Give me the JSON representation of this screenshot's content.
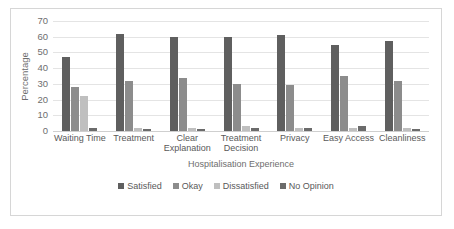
{
  "chart_data": {
    "type": "bar",
    "title": "",
    "xlabel": "Hospitalisation Experience",
    "ylabel": "Percentage",
    "ylim": [
      0,
      70
    ],
    "yticks": [
      0,
      10,
      20,
      30,
      40,
      50,
      60,
      70
    ],
    "grid": true,
    "legend_position": "bottom",
    "categories": [
      "Waiting Time",
      "Treatment",
      "Clear Explanation",
      "Treatment Decision",
      "Privacy",
      "Easy Access",
      "Cleanliness"
    ],
    "series": [
      {
        "name": "Satisfied",
        "color": "#5f5f5f",
        "values": [
          47,
          62,
          60,
          60,
          61,
          55,
          57
        ]
      },
      {
        "name": "Okay",
        "color": "#8c8c8c",
        "values": [
          28,
          32,
          34,
          30,
          29,
          35,
          32
        ]
      },
      {
        "name": "Dissatisfied",
        "color": "#bfbfbf",
        "values": [
          22,
          2,
          2,
          3,
          2,
          2,
          2
        ]
      },
      {
        "name": "No Opinion",
        "color": "#6b6b6b",
        "values": [
          2,
          1,
          1,
          2,
          2,
          3,
          1
        ]
      }
    ]
  },
  "axis": {
    "y_title": "Percentage",
    "x_title": "Hospitalisation Experience",
    "y_tick_labels": [
      "70",
      "60",
      "50",
      "40",
      "30",
      "20",
      "10",
      "0"
    ]
  },
  "legend": {
    "items": [
      {
        "label": "Satisfied"
      },
      {
        "label": "Okay"
      },
      {
        "label": "Dissatisfied"
      },
      {
        "label": "No Opinion"
      }
    ]
  }
}
